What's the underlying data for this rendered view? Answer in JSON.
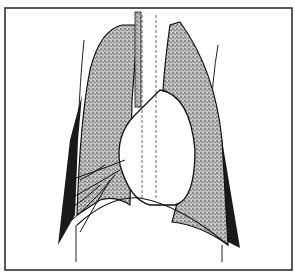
{
  "figure": {
    "type": "anatomical line illustration",
    "colors": {
      "background": "#ffffff",
      "ink": "#111111",
      "stipple": "#8a8a8a",
      "pleural_dark": "#1a1a1a"
    },
    "labels": []
  }
}
